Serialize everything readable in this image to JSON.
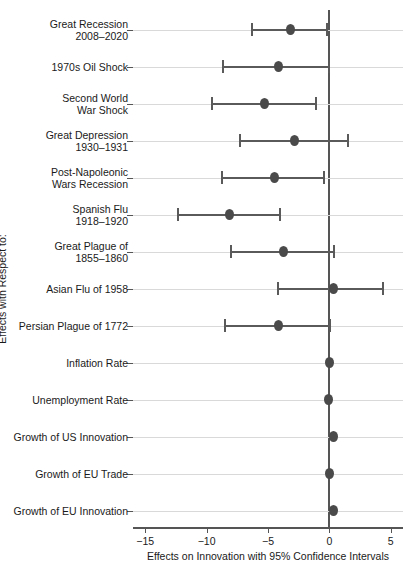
{
  "chart_data": {
    "type": "scatter",
    "title": "",
    "xlabel": "Effects on Innovation with 95% Confidence Intervals",
    "ylabel": "Effects with Respect to:",
    "xlim": [
      -16.0,
      6.0
    ],
    "xticks": [
      -15,
      -10,
      -5,
      0,
      5
    ],
    "xticklabels": [
      "−15",
      "−10",
      "−5",
      "0",
      "5"
    ],
    "grid": "horizontal",
    "legend": "none",
    "reference_line": 0,
    "categories": [
      "Great Recession\n2008–2020",
      "1970s Oil Shock",
      "Second World\nWar Shock",
      "Great Depression\n1930–1931",
      "Post-Napoleonic\nWars Recession",
      "Spanish Flu\n1918–1920",
      "Great Plague of\n1855–1860",
      "Asian Flu of 1958",
      "Persian Plague of 1772",
      "Inflation Rate",
      "Unemployment Rate",
      "Growth of US Innovation",
      "Growth of EU Trade",
      "Growth of EU Innovation"
    ],
    "points": [
      {
        "label": "Great Recession 2008–2020",
        "estimate": -3.23,
        "ci_low": -6.27,
        "ci_high": -0.22
      },
      {
        "label": "1970s Oil Shock",
        "estimate": -4.22,
        "ci_low": -8.65,
        "ci_high": -0.02
      },
      {
        "label": "Second World War Shock",
        "estimate": -5.3,
        "ci_low": -9.54,
        "ci_high": -1.1
      },
      {
        "label": "Great Depression 1930–1931",
        "estimate": -2.88,
        "ci_low": -7.26,
        "ci_high": 1.48
      },
      {
        "label": "Post-Napoleonic Wars Recession",
        "estimate": -4.54,
        "ci_low": -8.73,
        "ci_high": -0.4
      },
      {
        "label": "Spanish Flu 1918–1920",
        "estimate": -8.2,
        "ci_low": -12.34,
        "ci_high": -4.06
      },
      {
        "label": "Great Plague of 1855–1860",
        "estimate": -3.79,
        "ci_low": -8.04,
        "ci_high": 0.35
      },
      {
        "label": "Asian Flu of 1958",
        "estimate": 0.3,
        "ci_low": -4.17,
        "ci_high": 4.33
      },
      {
        "label": "Persian Plague of 1772",
        "estimate": -4.22,
        "ci_low": -8.47,
        "ci_high": 0.02
      },
      {
        "label": "Inflation Rate",
        "estimate": 0.0,
        "ci_low": -0.12,
        "ci_high": 0.12
      },
      {
        "label": "Unemployment Rate",
        "estimate": -0.08,
        "ci_low": -0.2,
        "ci_high": 0.05
      },
      {
        "label": "Growth of US Innovation",
        "estimate": 0.3,
        "ci_low": 0.1,
        "ci_high": 0.5
      },
      {
        "label": "Growth of EU Trade",
        "estimate": 0.0,
        "ci_low": -0.1,
        "ci_high": 0.1
      },
      {
        "label": "Growth of EU Innovation",
        "estimate": 0.32,
        "ci_low": 0.12,
        "ci_high": 0.52
      }
    ],
    "colors": {
      "marker": "#4a4a4a",
      "interval": "#5a5a5a",
      "gridline": "#d9d9d9",
      "axis": "#555555",
      "reference": "#555555",
      "text": "#1a1a1a",
      "background": "#ffffff"
    }
  }
}
